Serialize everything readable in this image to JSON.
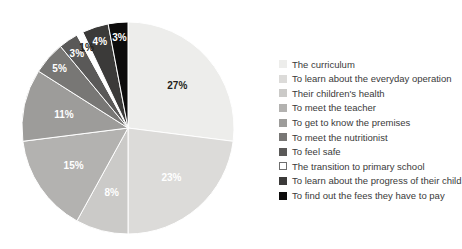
{
  "chart_data": {
    "type": "pie",
    "title": "",
    "xlabel": "",
    "ylabel": "",
    "legend_position": "right",
    "grid": false,
    "start_angle_deg": 0,
    "direction": "clockwise",
    "categories": [
      "The curriculum",
      "To learn about the everyday operation",
      "Their children's health",
      "To meet the teacher",
      "To get to know the premises",
      "To meet the nutritionist",
      "To feel safe",
      "The transition to primary school",
      "To learn about the progress of their child",
      "To find out the fees they have to pay"
    ],
    "values": [
      27,
      23,
      8,
      15,
      11,
      5,
      3,
      1,
      4,
      3
    ],
    "value_labels": [
      "27%",
      "23%",
      "8%",
      "15%",
      "11%",
      "5%",
      "3%",
      "1%",
      "4%",
      "3%"
    ],
    "colors": [
      "#ededeb",
      "#dcdbd9",
      "#cbcac8",
      "#b3b2b0",
      "#9d9c9a",
      "#787775",
      "#5a5958",
      "#ffffff",
      "#3b3a39",
      "#0d0c0c"
    ],
    "label_text_colors": [
      "dark",
      "light",
      "light",
      "light",
      "light",
      "light",
      "light",
      "dark",
      "light",
      "light"
    ]
  },
  "legend": {
    "items": [
      {
        "label": "The curriculum",
        "color": "#ededeb",
        "bordered": false
      },
      {
        "label": "To learn about the everyday operation",
        "color": "#dcdbd9",
        "bordered": false
      },
      {
        "label": "Their children's health",
        "color": "#cbcac8",
        "bordered": false
      },
      {
        "label": "To meet the teacher",
        "color": "#b3b2b0",
        "bordered": false
      },
      {
        "label": "To get to know the premises",
        "color": "#9d9c9a",
        "bordered": false
      },
      {
        "label": "To meet the nutritionist",
        "color": "#787775",
        "bordered": false
      },
      {
        "label": "To feel safe",
        "color": "#5a5958",
        "bordered": false
      },
      {
        "label": "The transition to primary school",
        "color": "#ffffff",
        "bordered": true
      },
      {
        "label": "To learn about the progress of their child",
        "color": "#3b3a39",
        "bordered": false
      },
      {
        "label": "To find out the fees they have to pay",
        "color": "#0d0c0c",
        "bordered": false
      }
    ]
  },
  "geometry": {
    "center_x": 128,
    "center_y": 128,
    "radius": 106
  }
}
